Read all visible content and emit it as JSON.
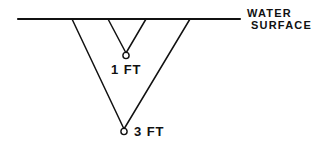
{
  "figure": {
    "background_color": "#ffffff",
    "ink_color": "#111111",
    "width": 326,
    "height": 150
  },
  "water_surface": {
    "label_line_1": "WATER",
    "label_line_2": "SURFACE",
    "line": {
      "x1": 18,
      "y1": 19,
      "x2": 240,
      "y2": 19
    }
  },
  "soundings": [
    {
      "id": "inner",
      "depth_label": "1 FT",
      "depth_value": 1,
      "unit": "FT",
      "left_leg": {
        "x1": 108,
        "y1": 19,
        "x2": 126,
        "y2": 53
      },
      "right_leg": {
        "x1": 146,
        "y1": 19,
        "x2": 126,
        "y2": 53
      },
      "apex": {
        "cx": 126,
        "cy": 55.5,
        "r": 3.1
      }
    },
    {
      "id": "outer",
      "depth_label": "3 FT",
      "depth_value": 3,
      "unit": "FT",
      "left_leg": {
        "x1": 72,
        "y1": 19,
        "x2": 124,
        "y2": 129
      },
      "right_leg": {
        "x1": 190,
        "y1": 19,
        "x2": 124,
        "y2": 129
      },
      "apex": {
        "cx": 124,
        "cy": 131.5,
        "r": 3.1
      }
    }
  ],
  "chart_data": {
    "type": "diagram",
    "xlabel": "",
    "ylabel": "Depth (FT)",
    "categories": [
      "1 FT sounding",
      "3 FT sounding"
    ],
    "values": [
      1,
      3
    ],
    "annotations": [
      "WATER SURFACE",
      "1 FT",
      "3 FT"
    ]
  }
}
